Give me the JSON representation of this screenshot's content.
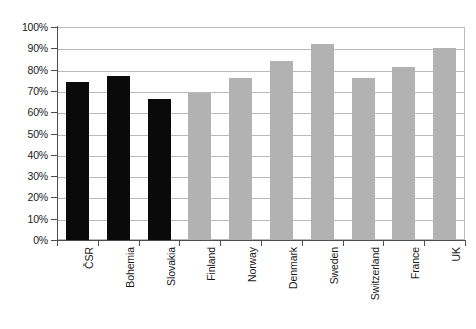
{
  "chart_data": {
    "type": "bar",
    "title": "",
    "subtitle": "",
    "xlabel": "",
    "ylabel": "",
    "categories": [
      "ČSR",
      "Bohemia",
      "Slovakia",
      "Finland",
      "Norway",
      "Denmark",
      "Sweden",
      "Switzerland",
      "France",
      "UK"
    ],
    "values": [
      74,
      77,
      66,
      69,
      76,
      84,
      92,
      76,
      81,
      90
    ],
    "value_unit": "%",
    "series": [
      {
        "name": "Share",
        "values": [
          74,
          77,
          66,
          69,
          76,
          84,
          92,
          76,
          81,
          90
        ]
      }
    ],
    "bar_colors": [
      "#0a0a0a",
      "#0a0a0a",
      "#0a0a0a",
      "#b2b2b2",
      "#b2b2b2",
      "#b2b2b2",
      "#b2b2b2",
      "#b2b2b2",
      "#b2b2b2",
      "#b2b2b2"
    ],
    "ylim": [
      0,
      100
    ],
    "ytick_values": [
      0,
      10,
      20,
      30,
      40,
      50,
      60,
      70,
      80,
      90,
      100
    ],
    "ytick_labels": [
      "0%",
      "10%",
      "20%",
      "30%",
      "40%",
      "50%",
      "60%",
      "70%",
      "80%",
      "90%",
      "100%"
    ],
    "grid": true,
    "grid_axis": "y",
    "legend": false,
    "legend_position": "none",
    "annotations": []
  },
  "colors": {
    "dark_bar": "#0a0a0a",
    "light_bar": "#b2b2b2",
    "gridline": "#b9b9b9",
    "axis": "#4d4d4d",
    "text": "#1a1a1a",
    "background": "#ffffff"
  }
}
